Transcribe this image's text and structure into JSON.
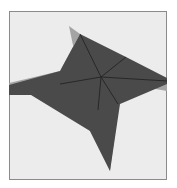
{
  "diagram": {
    "type": "folded-star-shape",
    "colors": {
      "background": "#ececec",
      "frame_border": "#8a8a8a",
      "dark_face": "#4a4a4a",
      "light_flap": "#a4a4a4",
      "crease": "#1e1e1e"
    },
    "center": [
      101,
      77
    ],
    "dark_polygon": [
      [
        80,
        34
      ],
      [
        126,
        57
      ],
      [
        167,
        78
      ],
      [
        167,
        84
      ],
      [
        120,
        104
      ],
      [
        110,
        171
      ],
      [
        90,
        131
      ],
      [
        31,
        95
      ],
      [
        9,
        95
      ],
      [
        9,
        85
      ],
      [
        60,
        71
      ]
    ],
    "light_flaps": [
      {
        "name": "top-left-flap",
        "points": [
          [
            69,
            26
          ],
          [
            80,
            34
          ],
          [
            60,
            71
          ],
          [
            74,
            50
          ]
        ]
      },
      {
        "name": "left-flap",
        "points": [
          [
            9,
            83
          ],
          [
            60,
            71
          ],
          [
            31,
            95
          ],
          [
            9,
            95
          ]
        ]
      },
      {
        "name": "right-flap",
        "points": [
          [
            167,
            84
          ],
          [
            167,
            91
          ],
          [
            150,
            88
          ]
        ]
      },
      {
        "name": "bottom-flap",
        "points": [
          [
            119,
            104
          ],
          [
            90,
            131
          ],
          [
            110,
            171
          ]
        ]
      }
    ],
    "creases": [
      [
        [
          101,
          77
        ],
        [
          80,
          34
        ]
      ],
      [
        [
          101,
          77
        ],
        [
          126,
          57
        ]
      ],
      [
        [
          101,
          77
        ],
        [
          167,
          81
        ]
      ],
      [
        [
          101,
          77
        ],
        [
          118,
          104
        ]
      ],
      [
        [
          101,
          77
        ],
        [
          98,
          110
        ]
      ],
      [
        [
          101,
          77
        ],
        [
          60,
          84
        ]
      ]
    ]
  }
}
